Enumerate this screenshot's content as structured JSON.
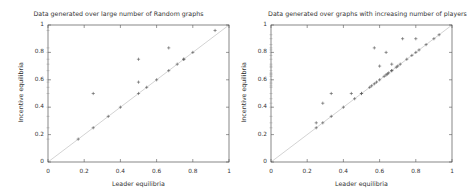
{
  "chart_data": [
    {
      "type": "scatter",
      "title": "Data generated over large number of Random graphs",
      "xlabel": "Leader equilibria",
      "ylabel": "Incentive equilibria",
      "xlim": [
        0,
        1
      ],
      "ylim": [
        0,
        1
      ],
      "xticks": [
        "0",
        "0.2",
        "0.4",
        "0.6",
        "0.8",
        "1"
      ],
      "yticks": [
        "0",
        "0.2",
        "0.4",
        "0.6",
        "0.8",
        "1"
      ],
      "grid": false,
      "reference_line": "y = x",
      "series": [
        {
          "name": "points",
          "marker": "+",
          "points": [
            [
              0.167,
              0.167
            ],
            [
              0.25,
              0.25
            ],
            [
              0.333,
              0.333
            ],
            [
              0.4,
              0.4
            ],
            [
              0.25,
              0.5
            ],
            [
              0.5,
              0.5
            ],
            [
              0.5,
              0.583
            ],
            [
              0.5,
              0.75
            ],
            [
              0.545,
              0.545
            ],
            [
              0.6,
              0.6
            ],
            [
              0.667,
              0.667
            ],
            [
              0.667,
              0.833
            ],
            [
              0.714,
              0.714
            ],
            [
              0.75,
              0.75
            ],
            [
              0.75,
              0.75
            ],
            [
              0.8,
              0.8
            ],
            [
              0.923,
              0.96
            ]
          ]
        }
      ]
    },
    {
      "type": "scatter",
      "title": "Data generated over graphs with increasing number of players",
      "xlabel": "Leader equilibria",
      "ylabel": "Incentive equilibria",
      "xlim": [
        0,
        1
      ],
      "ylim": [
        0,
        1
      ],
      "xticks": [
        "0",
        "0.2",
        "0.4",
        "0.6",
        "0.8",
        "1"
      ],
      "yticks": [
        "0",
        "0.2",
        "0.4",
        "0.6",
        "0.8",
        "1"
      ],
      "grid": false,
      "reference_line": "y = x",
      "series": [
        {
          "name": "points",
          "marker": "+",
          "points": [
            [
              0.25,
              0.25
            ],
            [
              0.25,
              0.286
            ],
            [
              0.286,
              0.286
            ],
            [
              0.286,
              0.429
            ],
            [
              0.333,
              0.333
            ],
            [
              0.333,
              0.5
            ],
            [
              0.4,
              0.4
            ],
            [
              0.444,
              0.5
            ],
            [
              0.462,
              0.462
            ],
            [
              0.5,
              0.5
            ],
            [
              0.5,
              0.5
            ],
            [
              0.545,
              0.545
            ],
            [
              0.556,
              0.556
            ],
            [
              0.571,
              0.571
            ],
            [
              0.583,
              0.583
            ],
            [
              0.6,
              0.6
            ],
            [
              0.571,
              0.833
            ],
            [
              0.6,
              0.7
            ],
            [
              0.636,
              0.8
            ],
            [
              0.625,
              0.625
            ],
            [
              0.636,
              0.636
            ],
            [
              0.643,
              0.643
            ],
            [
              0.65,
              0.65
            ],
            [
              0.667,
              0.667
            ],
            [
              0.667,
              0.714
            ],
            [
              0.667,
              0.667
            ],
            [
              0.692,
              0.692
            ],
            [
              0.7,
              0.7
            ],
            [
              0.714,
              0.714
            ],
            [
              0.727,
              0.9
            ],
            [
              0.75,
              0.75
            ],
            [
              0.778,
              0.778
            ],
            [
              0.8,
              0.8
            ],
            [
              0.8,
              0.9
            ],
            [
              0.818,
              0.818
            ],
            [
              0.857,
              0.857
            ],
            [
              0.9,
              0.9
            ],
            [
              0.929,
              0.929
            ]
          ]
        }
      ]
    }
  ]
}
